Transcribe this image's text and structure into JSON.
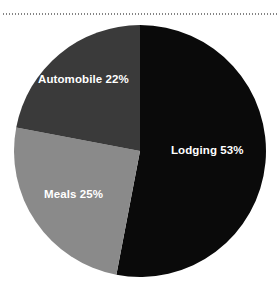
{
  "figure": {
    "background_color": "#ffffff",
    "rule": {
      "name": "dotted-separator",
      "style": "dotted",
      "color": "#6e6e6e"
    }
  },
  "chart_data": {
    "type": "pie",
    "title": "",
    "subtitle": "",
    "xlabel": "",
    "ylabel": "",
    "legend": "none",
    "grid": false,
    "label_format": "{name} {value}%",
    "start_angle_deg": 0,
    "direction": "clockwise",
    "center": {
      "x": 140,
      "y": 151
    },
    "radius": 126,
    "categories": [
      "Lodging",
      "Meals",
      "Automobile"
    ],
    "values": [
      53,
      25,
      22
    ],
    "colors": [
      "#0a0a0a",
      "#8a8a8a",
      "#3a3a3a"
    ],
    "slices": [
      {
        "name": "Lodging",
        "value": 53,
        "label": "Lodging 53%",
        "color": "#0a0a0a",
        "label_color": "#ffffff",
        "start_deg": 0,
        "sweep_deg": 190.8
      },
      {
        "name": "Meals",
        "value": 25,
        "label": "Meals 25%",
        "color": "#8a8a8a",
        "label_color": "#ffffff",
        "start_deg": 190.8,
        "sweep_deg": 90.0
      },
      {
        "name": "Automobile",
        "value": 22,
        "label": "Automobile 22%",
        "color": "#3a3a3a",
        "label_color": "#ffffff",
        "start_deg": 280.8,
        "sweep_deg": 79.2
      }
    ]
  }
}
